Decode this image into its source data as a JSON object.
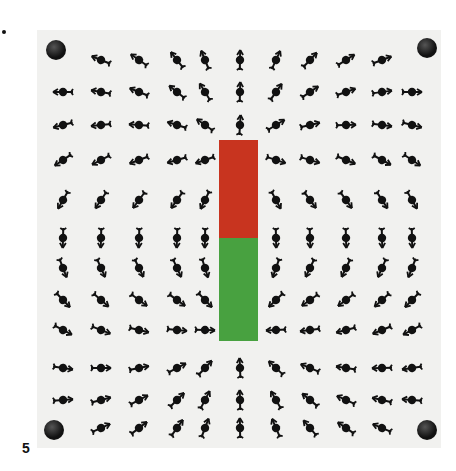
{
  "figure": {
    "label": "5",
    "colors": {
      "board": "#f1f1ef",
      "north_pole": "#c8341f",
      "south_pole": "#48a140",
      "compass": "#111111"
    },
    "magnet": {
      "north_label": "red half (top)",
      "south_label": "green half (bottom)"
    },
    "grid": {
      "columns": 11,
      "rows": 12
    }
  }
}
